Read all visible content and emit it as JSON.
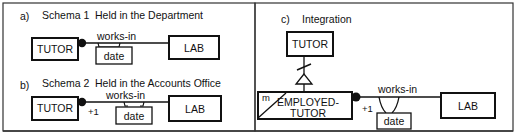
{
  "panels": {
    "a": {
      "marker": "a)",
      "schema": "Schema 1",
      "title": "Held in the Department",
      "entity_left": "TUTOR",
      "entity_right": "LAB",
      "relationship": "works-in",
      "attribute": "date"
    },
    "b": {
      "marker": "b)",
      "schema": "Schema 2",
      "title": "Held in the Accounts Office",
      "entity_left": "TUTOR",
      "entity_right": "LAB",
      "relationship": "works-in",
      "attribute": "date",
      "cardinality": "+1"
    },
    "c": {
      "marker": "c)",
      "title": "Integration",
      "supertype": "TUTOR",
      "subtype_line1": "EMPLOYED-",
      "subtype_line2": "TUTOR",
      "subtype_tag": "m",
      "entity_right": "LAB",
      "relationship": "works-in",
      "attribute": "date",
      "cardinality": "+1"
    }
  },
  "colors": {
    "line": "#111111",
    "frame": "#333333",
    "background": "#ffffff"
  }
}
